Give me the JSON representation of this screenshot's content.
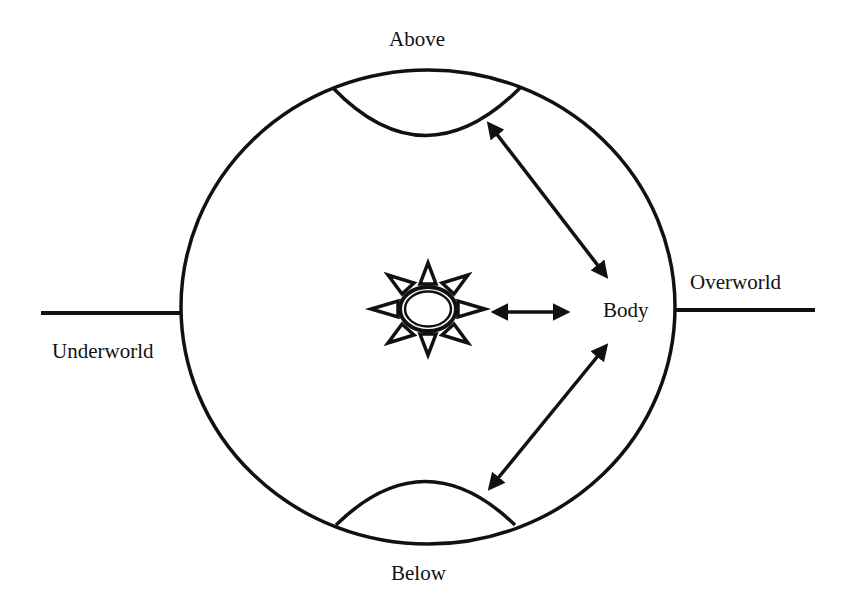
{
  "diagram": {
    "labels": {
      "above": "Above",
      "below": "Below",
      "body": "Body",
      "overworld": "Overworld",
      "underworld": "Underworld"
    },
    "nodes": [
      {
        "id": "above",
        "shape": "lens-segment-top"
      },
      {
        "id": "below",
        "shape": "lens-segment-bottom"
      },
      {
        "id": "center",
        "shape": "sun-star-icon"
      },
      {
        "id": "body",
        "shape": "text"
      }
    ],
    "edges": [
      {
        "from": "body",
        "to": "above",
        "type": "double-arrow"
      },
      {
        "from": "body",
        "to": "below",
        "type": "double-arrow"
      },
      {
        "from": "body",
        "to": "center",
        "type": "double-arrow"
      }
    ],
    "lines": [
      {
        "id": "overworld-line",
        "side": "right"
      },
      {
        "id": "underworld-line",
        "side": "left"
      }
    ],
    "colors": {
      "stroke": "#111111",
      "background": "#ffffff"
    }
  }
}
